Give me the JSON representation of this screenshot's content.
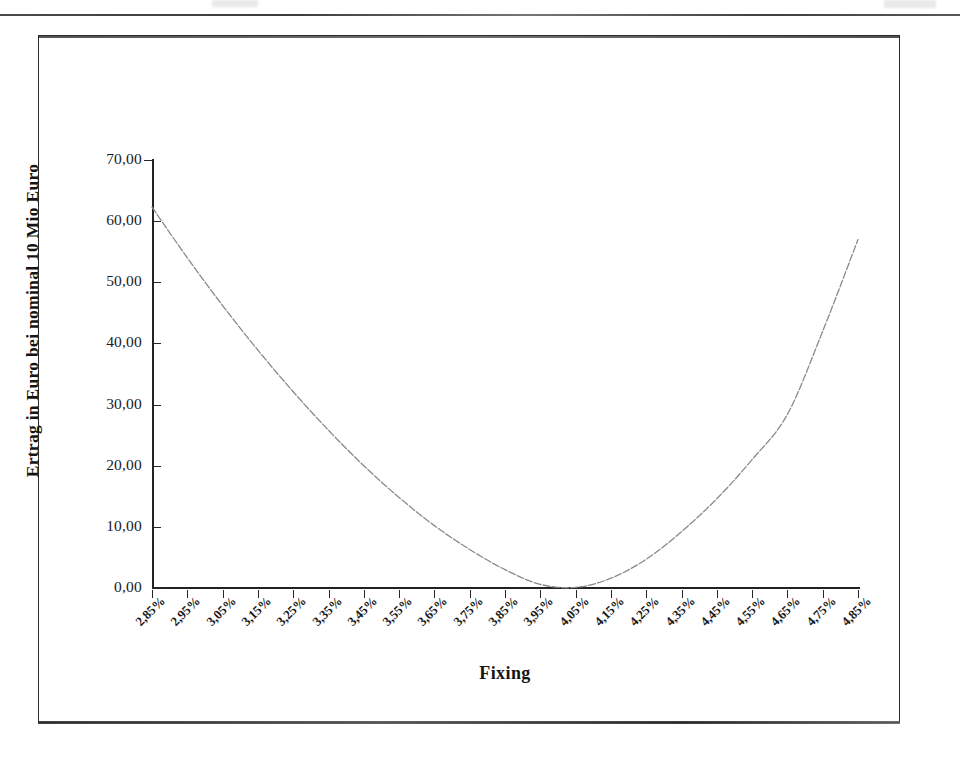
{
  "page": {
    "header_rule": "horizontal-rule",
    "footer_rule": "horizontal-rule"
  },
  "chart_data": {
    "type": "line",
    "title": "",
    "subtitle": "",
    "xlabel": "Fixing",
    "ylabel": "Ertrag in Euro bei nominal 10 Mio Euro",
    "grid": false,
    "legend": false,
    "legend_position": "none",
    "line_color": "#8a8a8a",
    "axis_color": "#232323",
    "x_tick_labels": [
      "2,85%",
      "2,95%",
      "3,05%",
      "3,15%",
      "3,25%",
      "3,35%",
      "3,45%",
      "3,55%",
      "3,65%",
      "3,75%",
      "3,85%",
      "3,95%",
      "4,05%",
      "4,15%",
      "4,25%",
      "4,35%",
      "4,45%",
      "4,55%",
      "4,65%",
      "4,75%",
      "4,85%"
    ],
    "x_tick_label_rotation_deg": -45,
    "y_tick_labels": [
      "0,00",
      "10,00",
      "20,00",
      "30,00",
      "40,00",
      "50,00",
      "60,00",
      "70,00"
    ],
    "y_tick_values": [
      0,
      10,
      20,
      30,
      40,
      50,
      60,
      70
    ],
    "ylim": [
      0,
      70
    ],
    "x": [
      "2,85%",
      "2,95%",
      "3,05%",
      "3,15%",
      "3,25%",
      "3,35%",
      "3,45%",
      "3,55%",
      "3,65%",
      "3,75%",
      "3,85%",
      "3,95%",
      "4,05%",
      "4,15%",
      "4,25%",
      "4,35%",
      "4,45%",
      "4,55%",
      "4,65%",
      "4,75%",
      "4,85%"
    ],
    "series": [
      {
        "name": "Ertrag",
        "values": [
          62.3,
          54.0,
          46.2,
          38.9,
          32.1,
          25.8,
          20.0,
          14.8,
          10.2,
          6.3,
          3.0,
          0.6,
          0.1,
          1.6,
          4.7,
          9.2,
          14.6,
          21.0,
          28.4,
          42.0,
          57.0
        ]
      }
    ],
    "annotations": []
  },
  "axis_titles": {
    "y": "Ertrag in Euro bei nominal 10 Mio Euro",
    "x": "Fixing"
  }
}
